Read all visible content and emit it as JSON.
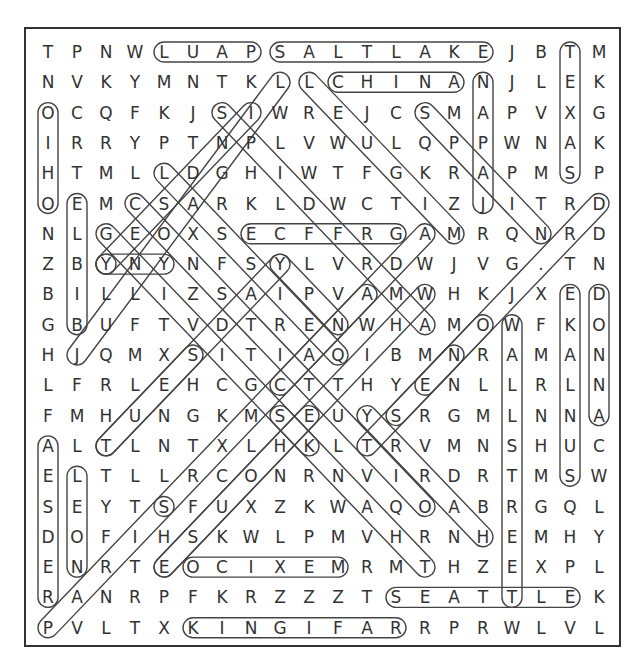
{
  "puzzle": {
    "title_partial": "",
    "rows": [
      "TPNWLUAPSALTLAKEJBTM",
      "NVKYMNTKLLCHINANJLEK",
      "OCQFKJSIWREJCSMAPVXG",
      "IRRYPTNPLVWULQPPWNAK",
      "HTMLLDGHIWTFGKRAPMSP",
      "OEMCSARKLDWCTIZJITRD",
      "NLGEOXSECFFRGAMRQNRD",
      "ZBYNYNFSYLVRDWJVG.TN",
      "BILLIZSAIPVAMWHKJXED",
      "GBUFTVDTRENWHAMOWFKO",
      "HJQMXSITIAQIBMNRAMAN",
      "LFRLEHCGCTTHYENLLRLN",
      "FMHUNGKMSEUYSRGMLNNA",
      "ALTLNTXLHKLTRVMNSHUC",
      "ELTLLRCONRNVIRDRTMSW",
      "SEYTSFUXZKWAQOABRGQL",
      "DOFIHSKWLPMVHRNHEMHY",
      "ENRTEOCIXEMRMTHZEXPL",
      "RANRPFKRZZZTSEATTLEK",
      "PVLTXKINGIFARRPRWLVL"
    ],
    "found_words": [
      {
        "word": "LUAP",
        "from": [
          1,
          5
        ],
        "to": [
          1,
          8
        ]
      },
      {
        "word": "SALTLAKE",
        "from": [
          1,
          9
        ],
        "to": [
          1,
          16
        ]
      },
      {
        "word": "CHINA",
        "from": [
          2,
          11
        ],
        "to": [
          2,
          15
        ]
      },
      {
        "word": "ECFFRG",
        "from": [
          7,
          8
        ],
        "to": [
          7,
          13
        ]
      },
      {
        "word": "OCIXEM",
        "from": [
          18,
          6
        ],
        "to": [
          18,
          11
        ]
      },
      {
        "word": "SEATTLE",
        "from": [
          19,
          13
        ],
        "to": [
          19,
          19
        ]
      },
      {
        "word": "KINGIFAR",
        "from": [
          20,
          6
        ],
        "to": [
          20,
          13
        ]
      },
      {
        "word": "TEXAS",
        "from": [
          1,
          19
        ],
        "to": [
          5,
          19
        ]
      },
      {
        "word": "NAPAJ",
        "from": [
          2,
          16
        ],
        "to": [
          6,
          16
        ]
      },
      {
        "word": "OIHO",
        "from": [
          3,
          1
        ],
        "to": [
          6,
          1
        ]
      },
      {
        "word": "ELBIB",
        "from": [
          6,
          2
        ],
        "to": [
          10,
          2
        ]
      },
      {
        "word": "EKALNUS",
        "from": [
          9,
          19
        ],
        "to": [
          15,
          19
        ]
      },
      {
        "word": "DONNA",
        "from": [
          9,
          20
        ],
        "to": [
          13,
          20
        ]
      },
      {
        "word": "WALLSTREET",
        "from": [
          10,
          17
        ],
        "to": [
          19,
          17
        ]
      },
      {
        "word": "AESDER",
        "from": [
          14,
          1
        ],
        "to": [
          19,
          1
        ]
      },
      {
        "word": "LEON",
        "from": [
          15,
          2
        ],
        "to": [
          18,
          2
        ]
      },
      {
        "word": "SPAIN",
        "from": [
          3,
          14
        ],
        "to": [
          7,
          18
        ]
      },
      {
        "word": "LEUGIM",
        "from": [
          2,
          10
        ],
        "to": [
          7,
          15
        ]
      },
      {
        "word": "D-diag",
        "from": [
          6,
          20
        ],
        "to": [
          14,
          12
        ]
      },
      {
        "word": "L-diag",
        "from": [
          2,
          9
        ],
        "to": [
          11,
          2
        ]
      },
      {
        "word": "S-diag",
        "from": [
          3,
          7
        ],
        "to": [
          10,
          14
        ]
      },
      {
        "word": "I-diag",
        "from": [
          3,
          8
        ],
        "to": [
          8,
          3
        ]
      },
      {
        "word": "L-diag2",
        "from": [
          5,
          5
        ],
        "to": [
          11,
          11
        ]
      },
      {
        "word": "C-diag",
        "from": [
          6,
          4
        ],
        "to": [
          16,
          14
        ]
      },
      {
        "word": "G-diag",
        "from": [
          7,
          3
        ],
        "to": [
          14,
          10
        ]
      },
      {
        "word": "Y-diag",
        "from": [
          8,
          3
        ],
        "to": [
          8,
          3
        ]
      },
      {
        "word": "YNY",
        "from": [
          8,
          5
        ],
        "to": [
          8,
          3
        ]
      },
      {
        "word": "Y-diag2",
        "from": [
          8,
          9
        ],
        "to": [
          14,
          3
        ]
      },
      {
        "word": "Y-diag3",
        "from": [
          8,
          9
        ],
        "to": [
          10,
          11
        ]
      },
      {
        "word": "A-diag",
        "from": [
          7,
          14
        ],
        "to": [
          16,
          5
        ]
      },
      {
        "word": "W-diag",
        "from": [
          9,
          14
        ],
        "to": [
          18,
          5
        ]
      },
      {
        "word": "N-diag",
        "from": [
          11,
          15
        ],
        "to": [
          12,
          14
        ]
      },
      {
        "word": "C-diag2",
        "from": [
          12,
          9
        ],
        "to": [
          9,
          12
        ]
      },
      {
        "word": "Y-diag4",
        "from": [
          13,
          12
        ],
        "to": [
          17,
          16
        ]
      },
      {
        "word": "S-diag2",
        "from": [
          13,
          13
        ],
        "to": [
          10,
          16
        ]
      },
      {
        "word": "S-diag3",
        "from": [
          16,
          5
        ],
        "to": [
          20,
          1
        ]
      },
      {
        "word": "L-diag3",
        "from": [
          13,
          9
        ],
        "to": [
          18,
          14
        ]
      },
      {
        "word": "T-diag",
        "from": [
          14,
          3
        ],
        "to": [
          11,
          6
        ]
      },
      {
        "word": "E-diag",
        "from": [
          18,
          5
        ],
        "to": [
          13,
          10
        ]
      }
    ]
  }
}
